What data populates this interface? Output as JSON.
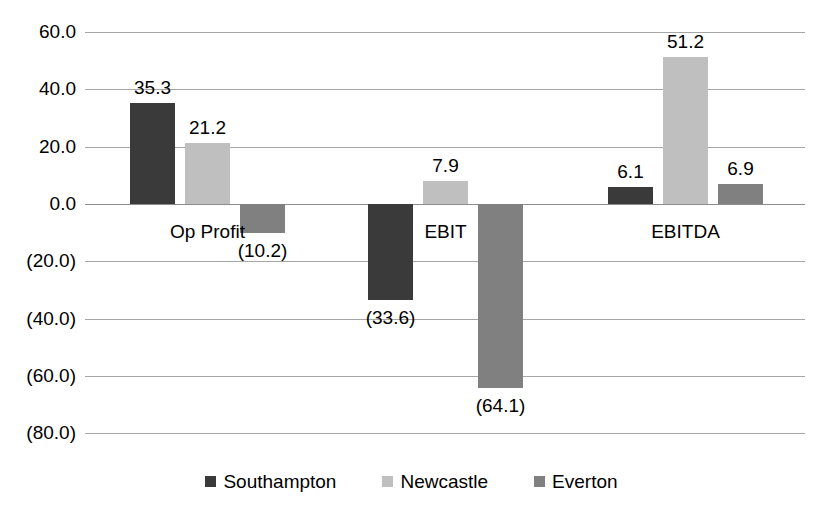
{
  "chart_data": {
    "type": "bar",
    "title": "",
    "subtitle": "",
    "xlabel": "",
    "ylabel": "",
    "categories": [
      "Op Profit",
      "EBIT",
      "EBITDA"
    ],
    "series": [
      {
        "name": "Southampton",
        "color": "#3a3a3a",
        "values": [
          35.3,
          -33.6,
          6.1
        ],
        "labels": [
          "35.3",
          "(33.6)",
          "6.1"
        ]
      },
      {
        "name": "Newcastle",
        "color": "#bfbfbf",
        "values": [
          21.2,
          7.9,
          51.2
        ],
        "labels": [
          "21.2",
          "7.9",
          "51.2"
        ]
      },
      {
        "name": "Everton",
        "color": "#808080",
        "values": [
          -10.2,
          -64.1,
          6.9
        ],
        "labels": [
          "(10.2)",
          "(64.1)",
          "6.9"
        ]
      }
    ],
    "ylim": [
      -80.0,
      60.0
    ],
    "ytick_values": [
      60.0,
      40.0,
      20.0,
      0.0,
      -20.0,
      -40.0,
      -60.0,
      -80.0
    ],
    "ytick_labels": [
      "60.0",
      "40.0",
      "20.0",
      "0.0",
      "(20.0)",
      "(40.0)",
      "(60.0)",
      "(80.0)"
    ],
    "grid": true,
    "legend_position": "bottom",
    "data_labels": true
  },
  "legend": {
    "items": [
      {
        "label": "Southampton"
      },
      {
        "label": "Newcastle"
      },
      {
        "label": "Everton"
      }
    ]
  }
}
